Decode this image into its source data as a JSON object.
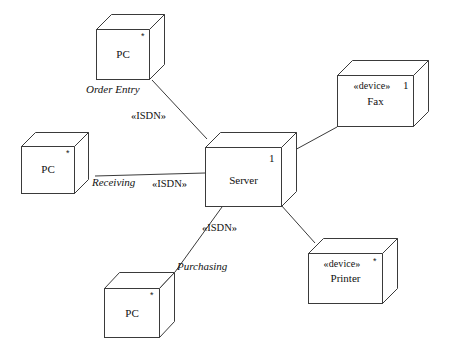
{
  "diagram": {
    "type": "uml-deployment-diagram",
    "title": "",
    "stroke_color": "#3a3a3a",
    "text_color": "#111111",
    "background": "#ffffff",
    "nodes": [
      {
        "id": "pc-order-entry",
        "label": "PC",
        "stereotype": "",
        "multiplicity": "*",
        "shape": "3d-box"
      },
      {
        "id": "pc-receiving",
        "label": "PC",
        "stereotype": "",
        "multiplicity": "*",
        "shape": "3d-box"
      },
      {
        "id": "pc-purchasing",
        "label": "PC",
        "stereotype": "",
        "multiplicity": "*",
        "shape": "3d-box"
      },
      {
        "id": "server",
        "label": "Server",
        "stereotype": "",
        "multiplicity": "1",
        "shape": "3d-box"
      },
      {
        "id": "fax",
        "label": "Fax",
        "stereotype": "«device»",
        "multiplicity": "1",
        "shape": "3d-box"
      },
      {
        "id": "printer",
        "label": "Printer",
        "stereotype": "«device»",
        "multiplicity": "*",
        "shape": "3d-box"
      }
    ],
    "connections": [
      {
        "id": "order-entry-link",
        "from": "pc-order-entry",
        "to": "server",
        "role": "Order Entry",
        "stereotype": "«ISDN»"
      },
      {
        "id": "receiving-link",
        "from": "pc-receiving",
        "to": "server",
        "role": "Receiving",
        "stereotype": "«ISDN»"
      },
      {
        "id": "purchasing-link",
        "from": "pc-purchasing",
        "to": "server",
        "role": "Purchasing",
        "stereotype": "«ISDN»"
      },
      {
        "id": "fax-link",
        "from": "server",
        "to": "fax",
        "role": "",
        "stereotype": ""
      },
      {
        "id": "printer-link",
        "from": "server",
        "to": "printer",
        "role": "",
        "stereotype": ""
      }
    ]
  }
}
